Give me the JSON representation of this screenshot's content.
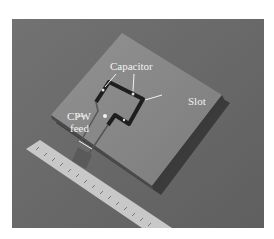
{
  "figure": {
    "labels": {
      "capacitor": "Capacitor",
      "slot": "Slot",
      "cpw_line1": "CPW",
      "cpw_line2": "feed"
    },
    "colors": {
      "background": "#6b6b6b",
      "board": "#8a8a8a",
      "slot": "#1e1e1e",
      "ruler": "#c8c8c8",
      "label_text": "#f2f2f2"
    }
  }
}
